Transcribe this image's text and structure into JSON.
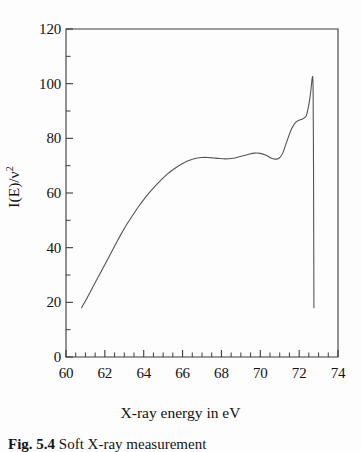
{
  "figure": {
    "caption_label": "Fig. 5.4",
    "caption_text": "Soft X-ray measurement",
    "x_axis_title": "X-ray energy in eV",
    "y_axis_title_main": "I(E)/ν",
    "y_axis_title_sup": "2",
    "line_color": "#555555",
    "axis_color": "#3a3a3a",
    "background_color": "#fdfdfd"
  },
  "chart_data": {
    "type": "line",
    "title": "",
    "xlabel": "X-ray energy in eV",
    "ylabel": "I(E)/ν²",
    "xlim": [
      60,
      74
    ],
    "ylim": [
      0,
      120
    ],
    "grid": false,
    "legend": "none",
    "x_ticks": [
      60,
      62,
      64,
      66,
      68,
      70,
      72,
      74
    ],
    "x_tick_labels": [
      "60",
      "62",
      "64",
      "66",
      "68",
      "70",
      "72",
      "74"
    ],
    "x_minor_tick_step": 0.5,
    "y_ticks": [
      0,
      20,
      40,
      60,
      80,
      100,
      120
    ],
    "y_tick_labels": [
      "0",
      "20",
      "40",
      "60",
      "80",
      "100",
      "120"
    ],
    "y_minor_tick_step": 10,
    "series": [
      {
        "name": "I(E)/v^2",
        "x": [
          60.8,
          61.0,
          61.3,
          61.6,
          61.9,
          62.2,
          62.5,
          62.8,
          63.1,
          63.4,
          63.7,
          64.0,
          64.3,
          64.6,
          64.9,
          65.2,
          65.5,
          65.8,
          66.1,
          66.4,
          66.7,
          67.0,
          67.3,
          67.6,
          67.9,
          68.2,
          68.5,
          68.8,
          69.1,
          69.4,
          69.7,
          70.0,
          70.3,
          70.55,
          70.75,
          70.95,
          71.15,
          71.35,
          71.55,
          71.75,
          71.95,
          72.15,
          72.35,
          72.45,
          72.55,
          72.62,
          72.66,
          72.7,
          72.72,
          72.74,
          72.76
        ],
        "y": [
          18.0,
          20.5,
          24.5,
          28.5,
          32.5,
          36.5,
          40.5,
          44.5,
          48.2,
          51.5,
          54.7,
          57.6,
          60.2,
          62.6,
          64.8,
          66.8,
          68.5,
          70.0,
          71.2,
          72.1,
          72.7,
          73.0,
          73.0,
          72.8,
          72.6,
          72.5,
          72.6,
          73.0,
          73.6,
          74.2,
          74.6,
          74.5,
          73.8,
          72.8,
          72.4,
          72.6,
          74.5,
          78.5,
          82.5,
          85.2,
          86.5,
          87.0,
          88.0,
          90.5,
          94.5,
          98.5,
          101.5,
          102.5,
          96.0,
          70.0,
          18.0
        ],
        "annotations": [
          {
            "label": "rising edge onset",
            "x": 60.8,
            "y": 18.0
          },
          {
            "label": "first plateau",
            "x": 67.1,
            "y": 73.0
          },
          {
            "label": "shallow minimum",
            "x": 68.3,
            "y": 72.5
          },
          {
            "label": "local maximum",
            "x": 69.7,
            "y": 74.6
          },
          {
            "label": "pre-peak dip",
            "x": 70.75,
            "y": 72.4
          },
          {
            "label": "shoulder",
            "x": 72.0,
            "y": 86.8
          },
          {
            "label": "white-line peak",
            "x": 72.7,
            "y": 102.5
          },
          {
            "label": "sharp cut-off",
            "x": 72.76,
            "y": 18.0
          }
        ]
      }
    ]
  },
  "geometry": {
    "plot_left_px": 66,
    "plot_right_px": 338,
    "plot_top_px": 29,
    "plot_bottom_px": 357
  }
}
